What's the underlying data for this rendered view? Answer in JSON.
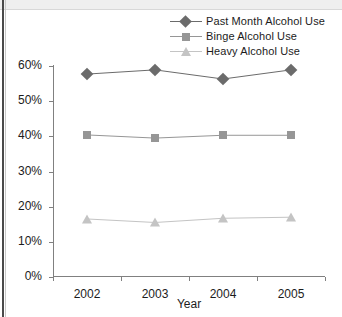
{
  "chart_data": {
    "type": "line",
    "title": "",
    "xlabel": "Year",
    "ylabel": "",
    "categories": [
      "2002",
      "2003",
      "2004",
      "2005"
    ],
    "ylim": [
      0,
      60
    ],
    "ytick_labels": [
      "0%",
      "10%",
      "20%",
      "30%",
      "40%",
      "50%",
      "60%"
    ],
    "ytick_values": [
      0,
      10,
      20,
      30,
      40,
      50,
      60
    ],
    "grid": false,
    "legend_position": "top-right",
    "series": [
      {
        "name": "Past Month Alcohol Use",
        "marker": "diamond",
        "color": "#6b6b6b",
        "values": [
          57.7,
          58.9,
          56.3,
          58.9
        ]
      },
      {
        "name": "Binge Alcohol Use",
        "marker": "square",
        "color": "#969696",
        "values": [
          40.4,
          39.5,
          40.3,
          40.3
        ]
      },
      {
        "name": "Heavy Alcohol Use",
        "marker": "triangle",
        "color": "#c4c4c4",
        "values": [
          16.5,
          15.5,
          16.7,
          17.0
        ]
      }
    ]
  },
  "axis": {
    "x_title": "Year"
  }
}
